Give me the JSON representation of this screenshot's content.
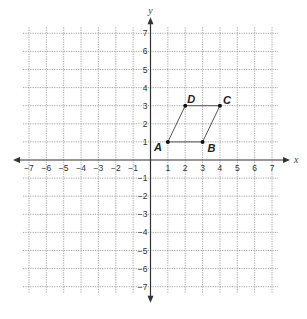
{
  "diagram": {
    "type": "coordinate-plane",
    "x_axis": {
      "label": "x",
      "min": -7,
      "max": 7,
      "ticks": [
        -7,
        -6,
        -5,
        -4,
        -3,
        -2,
        -1,
        1,
        2,
        3,
        4,
        5,
        6,
        7
      ]
    },
    "y_axis": {
      "label": "y",
      "min": -7,
      "max": 7,
      "ticks": [
        7,
        6,
        5,
        4,
        3,
        2,
        1,
        -1,
        -2,
        -3,
        -4,
        -5,
        -6,
        -7
      ]
    },
    "polygon": {
      "name": "parallelogram ABCD",
      "vertices": [
        {
          "label": "A",
          "x": 1,
          "y": 1
        },
        {
          "label": "B",
          "x": 3,
          "y": 1
        },
        {
          "label": "C",
          "x": 4,
          "y": 3
        },
        {
          "label": "D",
          "x": 2,
          "y": 3
        }
      ]
    },
    "colors": {
      "grid": "#9a9a9a",
      "axis": "#333333",
      "polygon": "#555555",
      "point": "#111111"
    }
  }
}
